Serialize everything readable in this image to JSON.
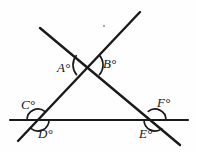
{
  "figure": {
    "type": "geometry-diagram",
    "background_color": "#fefefe",
    "stroke_color": "#1a1a1a",
    "width": 197,
    "height": 153,
    "lines": [
      {
        "name": "descending-transversal",
        "from": [
          40,
          28
        ],
        "to": [
          180,
          145
        ],
        "stroke_width": 2.4
      },
      {
        "name": "ascending-transversal",
        "from": [
          140,
          12
        ],
        "to": [
          18,
          141
        ],
        "stroke_width": 2.4
      },
      {
        "name": "horizontal-base-line",
        "from": [
          10,
          120
        ],
        "to": [
          188,
          120
        ],
        "stroke_width": 2.2
      }
    ],
    "vertices": [
      {
        "name": "top-crossing",
        "x": 88,
        "y": 65
      },
      {
        "name": "left-crossing",
        "x": 38,
        "y": 120
      },
      {
        "name": "right-crossing",
        "x": 155,
        "y": 120
      }
    ],
    "angle_marks": [
      {
        "name": "arc-A",
        "cx": 88,
        "cy": 65,
        "radius": 15,
        "start_deg": 140,
        "end_deg": 218
      },
      {
        "name": "arc-B",
        "cx": 88,
        "cy": 65,
        "radius": 15,
        "start_deg": 320,
        "end_deg": 40
      },
      {
        "name": "arc-C",
        "cx": 38,
        "cy": 120,
        "radius": 11,
        "start_deg": 180,
        "end_deg": 308
      },
      {
        "name": "arc-D",
        "cx": 38,
        "cy": 120,
        "radius": 11,
        "start_deg": 0,
        "end_deg": 128
      },
      {
        "name": "arc-F",
        "cx": 155,
        "cy": 120,
        "radius": 11,
        "start_deg": 232,
        "end_deg": 360
      },
      {
        "name": "arc-E",
        "cx": 155,
        "cy": 120,
        "radius": 11,
        "start_deg": 52,
        "end_deg": 180
      }
    ],
    "labels": [
      {
        "id": "A",
        "text": "A°",
        "x": 57,
        "y": 61
      },
      {
        "id": "B",
        "text": "B°",
        "x": 103,
        "y": 57
      },
      {
        "id": "C",
        "text": "C°",
        "x": 21,
        "y": 98
      },
      {
        "id": "D",
        "text": "D°",
        "x": 38,
        "y": 127
      },
      {
        "id": "E",
        "text": "E°",
        "x": 139,
        "y": 127
      },
      {
        "id": "F",
        "text": "F°",
        "x": 157,
        "y": 96
      }
    ],
    "marks": [
      {
        "name": "stray-speck",
        "x": 103,
        "y": 25
      }
    ]
  }
}
